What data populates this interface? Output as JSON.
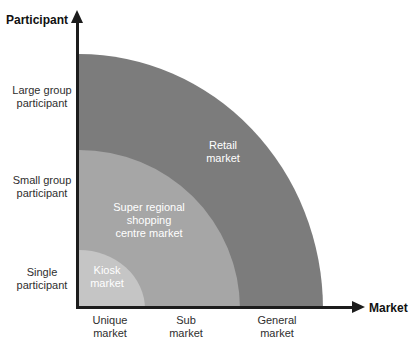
{
  "axes": {
    "y_title": "Participant",
    "x_title": "Market",
    "axis_color": "#1c1c1c"
  },
  "rings": [
    {
      "name": "retail-market",
      "label": "Retail\nmarket",
      "color": "#7c7c7c"
    },
    {
      "name": "super-regional-shopping-centre-market",
      "label": "Super regional\nshopping\ncentre market",
      "color": "#a6a6a6"
    },
    {
      "name": "kiosk-market",
      "label": "Kiosk\nmarket",
      "color": "#c5c5c5"
    }
  ],
  "participant_axis_labels": [
    {
      "text": "Large group\nparticipant"
    },
    {
      "text": "Small group\nparticipant"
    },
    {
      "text": "Single\nparticipant"
    }
  ],
  "market_axis_labels": [
    {
      "text": "Unique\nmarket"
    },
    {
      "text": "Sub\nmarket"
    },
    {
      "text": "General\nmarket"
    }
  ],
  "text_colors": {
    "ring_label": "#ffffff",
    "tick_label": "#2e2e2e",
    "axis_title": "#111111"
  }
}
